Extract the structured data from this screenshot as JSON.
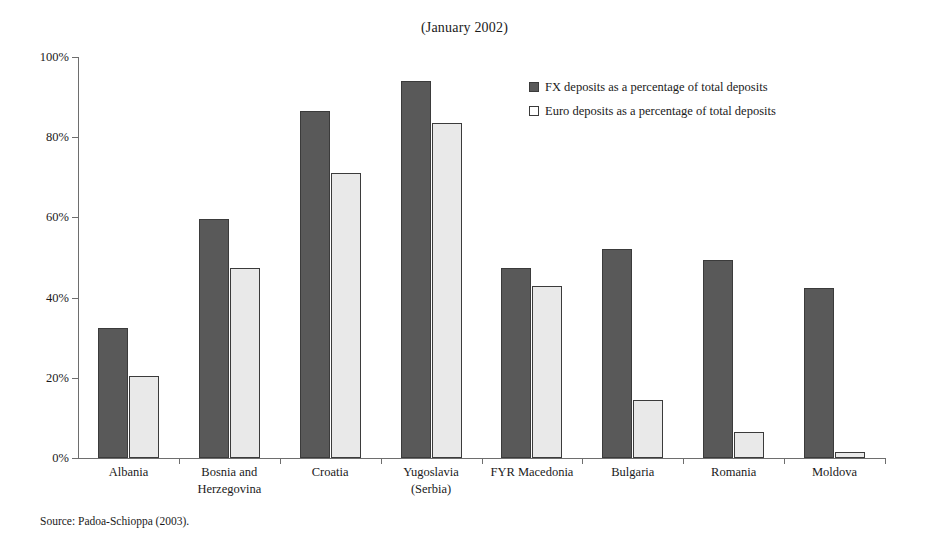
{
  "chart_data": {
    "type": "bar",
    "title": "(January 2002)",
    "xlabel": "",
    "ylabel": "",
    "ylim": [
      0,
      100
    ],
    "ytick_labels": [
      "0%",
      "20%",
      "40%",
      "60%",
      "80%",
      "100%"
    ],
    "ytick_values": [
      0,
      20,
      40,
      60,
      80,
      100
    ],
    "grid": false,
    "legend_position": "upper-right-inside",
    "categories": [
      "Albania",
      "Bosnia and\nHerzegovina",
      "Croatia",
      "Yugoslavia\n(Serbia)",
      "FYR Macedonia",
      "Bulgaria",
      "Romania",
      "Moldova"
    ],
    "series": [
      {
        "name": "FX deposits as a percentage of total deposits",
        "color": "#595959",
        "values": [
          32.5,
          59.5,
          86.5,
          94.0,
          47.5,
          52.0,
          49.5,
          42.5
        ]
      },
      {
        "name": "Euro deposits as a percentage of total deposits",
        "color": "#e9e9e9",
        "values": [
          20.5,
          47.5,
          71.0,
          83.5,
          43.0,
          14.5,
          6.5,
          1.5
        ]
      }
    ]
  },
  "source": "Source: Padoa-Schioppa (2003)."
}
